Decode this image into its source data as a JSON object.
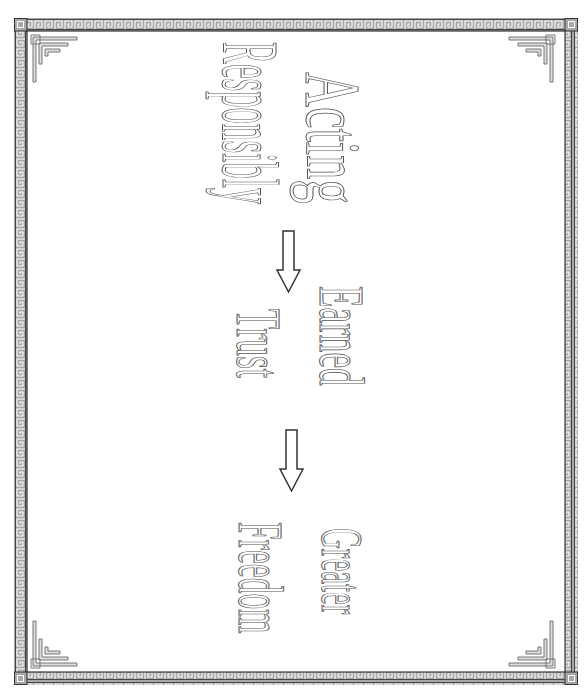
{
  "poster": {
    "title_lines": [
      {
        "line1": "Acting",
        "line2": "Responsibly"
      },
      {
        "line1": "Earned",
        "line2": "Trust"
      },
      {
        "line1": "Greater",
        "line2": "Freedom"
      }
    ],
    "arrows": [
      {
        "name": "arrow-down-1",
        "direction": "down"
      },
      {
        "name": "arrow-down-2",
        "direction": "down"
      }
    ],
    "colors": {
      "border_dark": "#333333",
      "border_fill": "#9a9a9a",
      "text_outline": "#555555",
      "background": "#ffffff"
    },
    "orientation": "text rotated 90deg clockwise"
  }
}
